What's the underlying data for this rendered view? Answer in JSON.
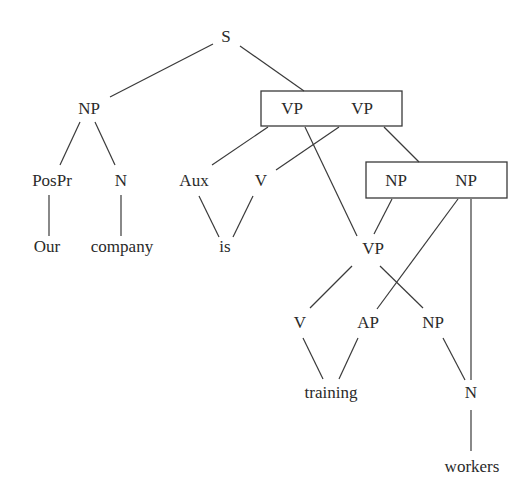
{
  "diagram": {
    "type": "syntax-tree",
    "sentence": "Our company is training workers",
    "nodes": {
      "s": "S",
      "np_subject": "NP",
      "pospr": "PosPr",
      "n_subject": "N",
      "our": "Our",
      "company": "company",
      "vp_box_left": "VP",
      "vp_box_right": "VP",
      "aux": "Aux",
      "v_is": "V",
      "is": "is",
      "np_box_left": "NP",
      "np_box_right": "NP",
      "vp_lower": "VP",
      "v_training": "V",
      "ap": "AP",
      "np_object": "NP",
      "training": "training",
      "n_object": "N",
      "workers": "workers"
    },
    "boxes": [
      {
        "id": "vp_box",
        "labels": [
          "VP",
          "VP"
        ]
      },
      {
        "id": "np_box",
        "labels": [
          "NP",
          "NP"
        ]
      }
    ],
    "edges": [
      [
        "S",
        "NP"
      ],
      [
        "S",
        "VP|VP box"
      ],
      [
        "NP",
        "PosPr"
      ],
      [
        "NP",
        "N"
      ],
      [
        "PosPr",
        "Our"
      ],
      [
        "N",
        "company"
      ],
      [
        "VP|VP box",
        "Aux"
      ],
      [
        "VP|VP box",
        "V"
      ],
      [
        "VP|VP box",
        "VP (lower)"
      ],
      [
        "VP|VP box",
        "NP|NP box"
      ],
      [
        "Aux",
        "is"
      ],
      [
        "V",
        "is"
      ],
      [
        "NP|NP box",
        "VP (lower)"
      ],
      [
        "NP|NP box",
        "AP"
      ],
      [
        "NP|NP box",
        "N (workers)"
      ],
      [
        "VP (lower)",
        "V"
      ],
      [
        "VP (lower)",
        "NP"
      ],
      [
        "V",
        "training"
      ],
      [
        "AP",
        "training"
      ],
      [
        "NP",
        "N"
      ],
      [
        "N",
        "workers"
      ]
    ],
    "colors": {
      "line": "#3a3a3a",
      "text": "#2a2a2a",
      "background": "#ffffff"
    }
  }
}
